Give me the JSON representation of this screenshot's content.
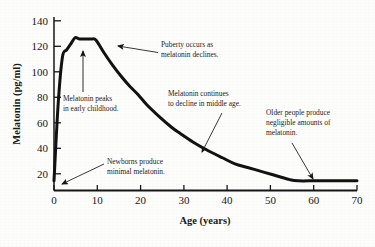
{
  "figure": {
    "background_color": "#fdfdfb",
    "ink_color": "#17171a"
  },
  "chart_data": {
    "type": "line",
    "title": "",
    "subtitle": "",
    "xlabel": "Age (years)",
    "ylabel": "Melatonin (pg/ml)",
    "xlim": [
      0,
      72
    ],
    "ylim": [
      0,
      145
    ],
    "xticks": [
      0,
      10,
      20,
      30,
      40,
      50,
      60,
      70
    ],
    "xtick_labels": [
      "0",
      "10",
      "20",
      "30",
      "40",
      "50",
      "60",
      "70"
    ],
    "yticks": [
      20,
      40,
      60,
      80,
      100,
      120,
      140
    ],
    "ytick_labels": [
      "20",
      "40",
      "60",
      "80",
      "100",
      "120",
      "140"
    ],
    "grid": false,
    "legend": false,
    "legend_position": "none",
    "line_color": "#121212",
    "line_width": 3,
    "series": [
      {
        "name": "Melatonin level",
        "x": [
          0,
          1,
          2,
          3,
          4,
          5,
          6,
          7,
          8,
          9,
          10,
          12,
          14,
          16,
          18,
          20,
          22,
          25,
          28,
          30,
          33,
          36,
          40,
          43,
          46,
          50,
          53,
          56,
          58,
          62,
          66,
          70,
          72
        ],
        "values": [
          8,
          72,
          110,
          116,
          121,
          126,
          125,
          125,
          125,
          125,
          124,
          113,
          103,
          94,
          86,
          79,
          71,
          61,
          52,
          47,
          40,
          34,
          27,
          22,
          19,
          15,
          12,
          9,
          8,
          8,
          8,
          8,
          8
        ]
      }
    ]
  },
  "annotations": [
    {
      "id": "puberty",
      "lines": [
        "Puberty occurs as",
        "melatonin declines."
      ],
      "points_to_age": 13,
      "points_to_value": 108
    },
    {
      "id": "peak",
      "lines": [
        "Melatonin peaks",
        "in early childhood."
      ],
      "points_to_age": 5,
      "points_to_value": 126
    },
    {
      "id": "middle-age",
      "lines": [
        "Melatonin continues",
        "to decline in middle age."
      ],
      "points_to_age": 35,
      "points_to_value": 36
    },
    {
      "id": "older-people",
      "lines": [
        "Older people produce",
        "negligible amounts of",
        "melatonin."
      ],
      "points_to_age": 60,
      "points_to_value": 9
    },
    {
      "id": "newborns",
      "lines": [
        "Newborns produce",
        "minimal melatonin."
      ],
      "points_to_age": 1,
      "points_to_value": 9
    }
  ]
}
